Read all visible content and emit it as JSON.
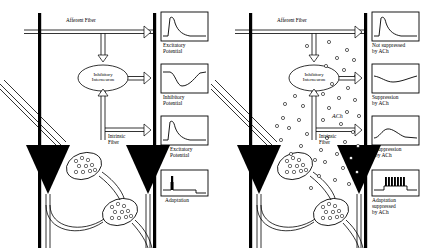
{
  "figure": {
    "type": "diagram",
    "panels": [
      {
        "id": "left",
        "condition": "control",
        "labels": {
          "afferent_fiber": "Afferent Fiber",
          "interneuron_line1": "Inhibitory",
          "interneuron_line2": "Interneuron",
          "intrinsic_line1": "Intrinsic",
          "intrinsic_line2": "Fiber"
        },
        "traces": [
          {
            "name": "excitatory-potential",
            "label_line1": "Excitatory",
            "label_line2": "Potential",
            "waveform": "fast-rise-exponential-decay-positive",
            "amplitude": "large"
          },
          {
            "name": "inhibitory-potential",
            "label_line1": "Inhibitory",
            "label_line2": "Potential",
            "waveform": "negative-deflection-slow-recovery",
            "amplitude": "large"
          },
          {
            "name": "excitatory-potential-2",
            "label_line1": "Excitatory",
            "label_line2": "Potential",
            "waveform": "fast-rise-exponential-decay-positive",
            "amplitude": "large"
          },
          {
            "name": "adaptation",
            "label_line1": "Adaptation",
            "label_line2": "",
            "waveform": "single-spike-then-plateau",
            "spikes": 1
          }
        ]
      },
      {
        "id": "right",
        "condition": "acetylcholine applied",
        "labels": {
          "afferent_fiber": "Afferent Fiber",
          "interneuron_line1": "Inhibitory",
          "interneuron_line2": "Interneuron",
          "intrinsic_line1": "Intrinsic",
          "intrinsic_line2": "Fiber",
          "ach": "ACh"
        },
        "traces": [
          {
            "name": "not-suppressed-by-ach",
            "label_line1": "Not suppressed",
            "label_line2": "by ACh",
            "waveform": "fast-rise-exponential-decay-positive",
            "amplitude": "large"
          },
          {
            "name": "suppression-by-ach-inhibitory",
            "label_line1": "Suppression",
            "label_line2": "by ACh",
            "waveform": "shallow-negative-deflection",
            "amplitude": "small"
          },
          {
            "name": "suppression-by-ach-excitatory",
            "label_line1": "Suppression",
            "label_line2": "by ACh",
            "waveform": "low-rounded-bump",
            "amplitude": "small"
          },
          {
            "name": "adaptation-suppressed-by-ach",
            "label_line1": "Adaptation",
            "label_line2": "suppressed",
            "label_line3": "by ACh",
            "waveform": "repetitive-spike-train-plateau",
            "spikes": 9
          }
        ]
      }
    ],
    "colors": {
      "ink": "#000000",
      "background": "#ffffff",
      "soma_fill": "#000000",
      "terminal_fill": "#ffffff"
    },
    "elements": {
      "pyramidal_cells": 2,
      "synaptic_terminals_with_vesicles": 2,
      "ach_particles": 44
    }
  }
}
